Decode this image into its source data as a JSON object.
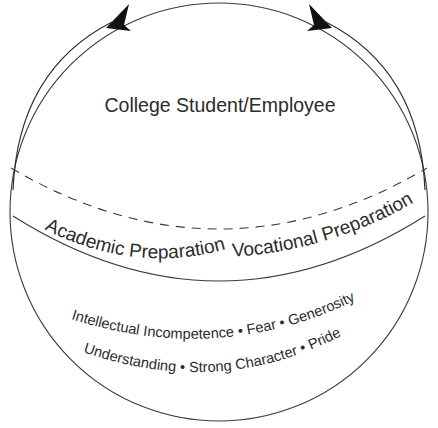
{
  "diagram": {
    "title": "College Student/Employee",
    "bands": {
      "left_label": "Academic Preparation",
      "right_label": "Vocational Preparation"
    },
    "attributes": {
      "line1": "Intellectual Incompetence • Fear • Generosity",
      "line2": "Understanding • Strong Character • Pride"
    },
    "icons": {
      "left_arrowhead": "arrowhead-up-right-icon",
      "right_arrowhead": "arrowhead-up-left-icon"
    },
    "colors": {
      "stroke": "#3a3a3a",
      "text": "#2b2b2b",
      "arrowhead_fill": "#111111",
      "background": "#ffffff"
    }
  }
}
